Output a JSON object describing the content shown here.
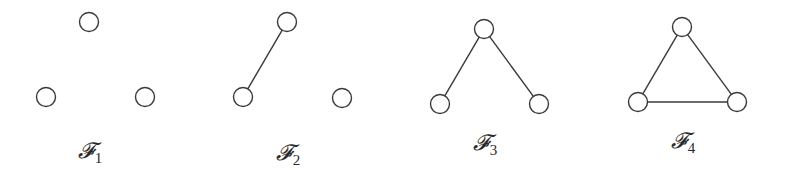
{
  "graphs": [
    {
      "id": "F1",
      "label_main": "𝓕",
      "label_sub": "1",
      "label_pos": [
        90,
        140
      ],
      "nodes": [
        [
          89,
          22
        ],
        [
          46,
          97
        ],
        [
          145,
          97
        ]
      ],
      "edges": []
    },
    {
      "id": "F2",
      "label_main": "𝓕",
      "label_sub": "2",
      "label_pos": [
        288,
        142
      ],
      "nodes": [
        [
          287,
          22
        ],
        [
          243,
          97
        ],
        [
          342,
          98
        ]
      ],
      "edges": [
        [
          0,
          1
        ]
      ]
    },
    {
      "id": "F3",
      "label_main": "𝓕",
      "label_sub": "3",
      "label_pos": [
        485,
        132
      ],
      "nodes": [
        [
          484,
          29
        ],
        [
          440,
          104
        ],
        [
          539,
          104
        ]
      ],
      "edges": [
        [
          0,
          1
        ],
        [
          0,
          2
        ]
      ]
    },
    {
      "id": "F4",
      "label_main": "𝓕",
      "label_sub": "4",
      "label_pos": [
        683,
        130
      ],
      "nodes": [
        [
          682,
          27
        ],
        [
          638,
          102
        ],
        [
          737,
          102
        ]
      ],
      "edges": [
        [
          0,
          1
        ],
        [
          0,
          2
        ],
        [
          1,
          2
        ]
      ]
    }
  ],
  "style": {
    "node_radius": 9.5,
    "stroke_color": "#3a3a3a",
    "background": "#ffffff"
  }
}
